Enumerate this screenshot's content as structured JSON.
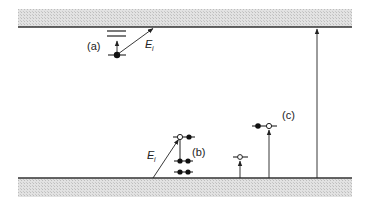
{
  "figure": {
    "top_band": {
      "name": "conduction-band",
      "fill": "#d9d9d9",
      "edge_color": "#333333"
    },
    "bottom_band": {
      "name": "valence-band",
      "fill": "#d9d9d9",
      "edge_color": "#333333"
    },
    "labels": {
      "a": "(a)",
      "b": "(b)",
      "c": "(c)",
      "ei_a_main": "E",
      "ei_a_sub": "i",
      "ei_b_main": "E",
      "ei_b_sub": "i"
    }
  }
}
